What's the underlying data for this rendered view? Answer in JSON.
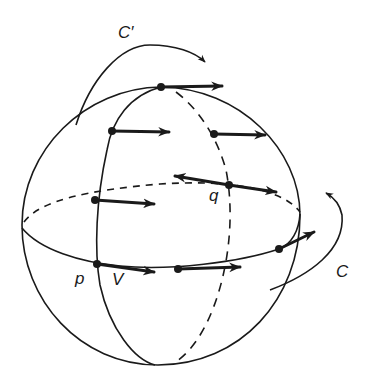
{
  "figure": {
    "colors": {
      "ink": "#1a1a1a",
      "background": "#ffffff"
    },
    "labels": {
      "c_prime": "C′",
      "c": "C",
      "p": "p",
      "q": "q",
      "v": "V"
    },
    "curves": [
      {
        "id": "sphere-outline",
        "style": "solid"
      },
      {
        "id": "equator-front",
        "style": "solid"
      },
      {
        "id": "equator-back",
        "style": "dashed"
      },
      {
        "id": "meridian-front",
        "style": "solid"
      },
      {
        "id": "meridian-back",
        "style": "dashed"
      },
      {
        "id": "loop-c-prime",
        "style": "solid-arrow"
      },
      {
        "id": "loop-c",
        "style": "solid-arrow"
      }
    ],
    "points": [
      {
        "id": "north-pole",
        "x": 161,
        "y": 87
      },
      {
        "id": "meridian-front-upper",
        "x": 112,
        "y": 131
      },
      {
        "id": "meridian-back-upper",
        "x": 214,
        "y": 134
      },
      {
        "id": "q",
        "x": 229,
        "y": 185
      },
      {
        "id": "meridian-front-mid",
        "x": 95,
        "y": 200
      },
      {
        "id": "p",
        "x": 97,
        "y": 264
      },
      {
        "id": "equator-front-mid",
        "x": 178,
        "y": 269
      },
      {
        "id": "equator-front-right",
        "x": 279,
        "y": 249
      }
    ]
  }
}
